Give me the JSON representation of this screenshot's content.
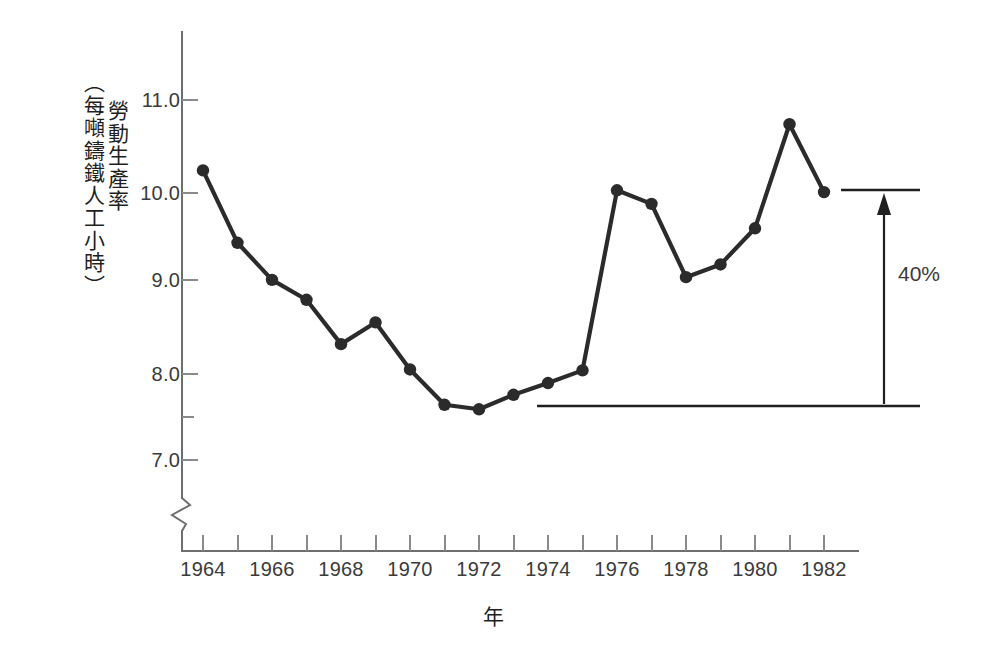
{
  "chart_data": {
    "type": "line",
    "title": "",
    "xlabel": "年",
    "ylabel_main": "勞動生產率",
    "ylabel_unit": "（每噸鑄鐵人工小時）",
    "x": [
      1964,
      1965,
      1966,
      1967,
      1968,
      1969,
      1970,
      1971,
      1972,
      1973,
      1974,
      1975,
      1976,
      1977,
      1978,
      1979,
      1980,
      1981,
      1982
    ],
    "values": [
      10.25,
      9.45,
      9.04,
      8.82,
      8.33,
      8.57,
      8.05,
      7.66,
      7.61,
      7.77,
      7.9,
      8.04,
      10.03,
      9.88,
      9.07,
      9.21,
      9.61,
      10.76,
      10.01
    ],
    "series": [
      {
        "name": "勞動生產率",
        "values": [
          10.25,
          9.45,
          9.04,
          8.82,
          8.33,
          8.57,
          8.05,
          7.66,
          7.61,
          7.77,
          7.9,
          8.04,
          10.03,
          9.88,
          9.07,
          9.21,
          9.61,
          10.76,
          10.01
        ]
      }
    ],
    "xtick_labels": [
      "1964",
      "1966",
      "1968",
      "1970",
      "1972",
      "1974",
      "1976",
      "1978",
      "1980",
      "1982"
    ],
    "xtick_values": [
      1964,
      1966,
      1968,
      1970,
      1972,
      1974,
      1976,
      1978,
      1980,
      1982
    ],
    "xtick_minor_values": [
      1965,
      1967,
      1969,
      1971,
      1973,
      1975,
      1977,
      1979,
      1981
    ],
    "ytick_labels": [
      "7.0",
      "8.0",
      "9.0",
      "10.0",
      "11.0"
    ],
    "ytick_values": [
      7.0,
      8.0,
      9.0,
      10.0,
      11.0
    ],
    "ytick_minor_values": [
      7.5
    ],
    "ylim": [
      6.45,
      11.45
    ],
    "xlim": [
      1963.2,
      1983.5
    ],
    "grid": false,
    "legend": "none",
    "axis_break": true,
    "axis_break_note": "y-axis zigzag break below 7.0",
    "line_color": "#2b2b2b",
    "marker_color": "#2b2b2b",
    "axis_color": "#6e6e6e",
    "background": "#ffffff",
    "annotations": [
      {
        "name": "growth-bracket",
        "label": "40%",
        "from_value": 7.61,
        "to_value": 10.01,
        "from_year": 1973.6,
        "to_year": 1982.9,
        "arrow": "up"
      }
    ]
  },
  "axis_titles": {
    "x": "年",
    "y_main": "勞動生產率",
    "y_unit": "（每噸鑄鐵人工小時）"
  },
  "annotation": {
    "percent_label": "40%"
  }
}
